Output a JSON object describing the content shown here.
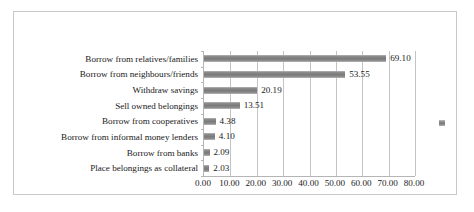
{
  "chart_data": {
    "type": "bar",
    "orientation": "horizontal",
    "title": "",
    "xlabel": "",
    "ylabel": "",
    "categories": [
      "Borrow from relatives/families",
      "Borrow from neighbours/friends",
      "Withdraw savings",
      "Sell owned belongings",
      "Borrow from cooperatives",
      "Borrow from informal money lenders",
      "Borrow from banks",
      "Place belongings as collateral"
    ],
    "values": [
      69.1,
      53.55,
      20.19,
      13.51,
      4.38,
      4.1,
      2.09,
      2.03
    ],
    "value_labels": [
      "69.10",
      "53.55",
      "20.19",
      "13.51",
      "4.38",
      "4.10",
      "2.09",
      "2.03"
    ],
    "xlim": [
      0,
      80
    ],
    "xticks": [
      0,
      10,
      20,
      30,
      40,
      50,
      60,
      70,
      80
    ],
    "xtick_labels": [
      "0.00",
      "10.00",
      "20.00",
      "30.00",
      "40.00",
      "50.00",
      "60.00",
      "70.00",
      "80.00"
    ],
    "grid": "vertical",
    "legend": {
      "position": "right",
      "entries": [
        {
          "label": "",
          "color": "#808080"
        }
      ]
    },
    "series_color": "#808080",
    "border_color": "#c9c9c9",
    "axis_color": "#b5b5b5",
    "gridline_color": "#c4c4c4"
  }
}
